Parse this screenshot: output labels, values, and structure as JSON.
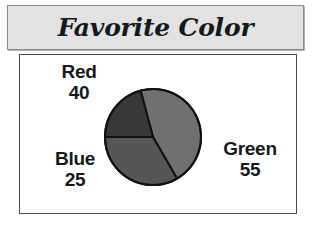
{
  "title": "Favorite Color",
  "chart_data": {
    "type": "pie",
    "title": "Favorite Color",
    "xlabel": "",
    "ylabel": "",
    "categories": [
      "Red",
      "Blue",
      "Green"
    ],
    "values": [
      40,
      25,
      55
    ],
    "total": 120,
    "labels_show_value": true,
    "legend": "none",
    "grid": false,
    "slices": [
      {
        "name": "Red",
        "value": 40,
        "color": "#565656",
        "start_angle_deg": 180,
        "sweep_deg": 120,
        "label_name": "Red",
        "label_value": "40"
      },
      {
        "name": "Blue",
        "value": 25,
        "color": "#383838",
        "start_angle_deg": 105,
        "sweep_deg": 75,
        "label_name": "Blue",
        "label_value": "25"
      },
      {
        "name": "Green",
        "value": 55,
        "color": "#707070",
        "start_angle_deg": 300,
        "sweep_deg": 165,
        "label_name": "Green",
        "label_value": "55"
      }
    ]
  },
  "colors": {
    "title_bar_fill": "#e2e2e2",
    "title_bar_border": "#8a8a8a",
    "plot_border": "#4b4b4b",
    "plot_fill": "#ffffff",
    "slice_outline": "#101010",
    "text": "#16191b"
  }
}
